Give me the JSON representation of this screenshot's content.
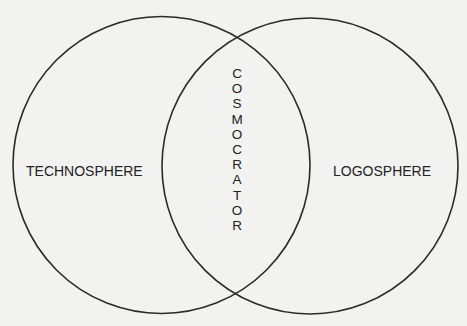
{
  "diagram": {
    "type": "venn",
    "left_set": {
      "label": "TECHNOSPHERE"
    },
    "right_set": {
      "label": "LOGOSPHERE"
    },
    "intersection": {
      "label": "COSMOCRATOR",
      "letters": [
        "C",
        "O",
        "S",
        "M",
        "O",
        "C",
        "R",
        "A",
        "T",
        "O",
        "R"
      ]
    },
    "colors": {
      "stroke": "#2a2a2a",
      "background": "#f2f2f0",
      "text": "#222222"
    }
  }
}
